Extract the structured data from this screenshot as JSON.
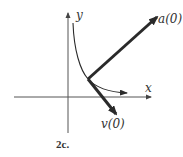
{
  "figure": {
    "caption": "2c.",
    "axes": {
      "x_label": "x",
      "y_label": "y"
    },
    "vectors": {
      "acceleration_label": "a(0)",
      "velocity_label": "v(0)"
    },
    "colors": {
      "line": "#2a2a2a",
      "axis": "#444444",
      "background": "#ffffff"
    }
  }
}
